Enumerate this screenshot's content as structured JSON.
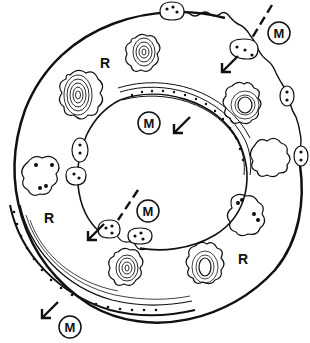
{
  "diagram": {
    "labels": {
      "region": "R",
      "marker": "M"
    },
    "region_labels": [
      {
        "id": "r1",
        "text": "R",
        "x": 105,
        "y": 62
      },
      {
        "id": "r2",
        "text": "R",
        "x": 50,
        "y": 217
      },
      {
        "id": "r3",
        "text": "R",
        "x": 243,
        "y": 258
      }
    ],
    "marker_labels": [
      {
        "id": "m1",
        "text": "M",
        "x": 279,
        "y": 33
      },
      {
        "id": "m2",
        "text": "M",
        "x": 149,
        "y": 123
      },
      {
        "id": "m3",
        "text": "M",
        "x": 148,
        "y": 211
      },
      {
        "id": "m4",
        "text": "M",
        "x": 70,
        "y": 327
      }
    ],
    "colors": {
      "line": "#111111",
      "background": "#ffffff"
    }
  }
}
